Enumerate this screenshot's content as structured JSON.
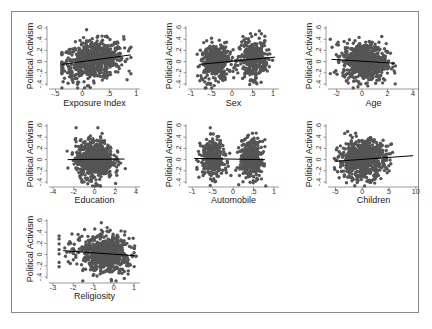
{
  "figure": {
    "frame_color": "#8a8a8a",
    "dot_color": "#555555",
    "line_color": "#000000"
  },
  "chart_data": [
    {
      "type": "scatter",
      "title": "",
      "xlabel": "Exposure Index",
      "ylabel": "Political Activism",
      "xticks": [
        "-.5",
        "0",
        ".5",
        "1"
      ],
      "xtick_values": [
        -0.5,
        0,
        0.5,
        1
      ],
      "xlim": [
        -0.6,
        1.05
      ],
      "yticks": [
        "-.4",
        "-.2",
        "0",
        ".2",
        ".4",
        ".6"
      ],
      "ytick_values": [
        -0.4,
        -0.2,
        0,
        0.2,
        0.4,
        0.6
      ],
      "ylim": [
        -0.5,
        0.65
      ],
      "distribution": {
        "x_center": 0.2,
        "x_spread": 0.28,
        "x_min": -0.38,
        "x_max": 0.9,
        "clusters": 1
      },
      "fit_line": {
        "x": [
          -0.38,
          0.9
        ],
        "y": [
          -0.05,
          0.12
        ]
      },
      "grid": false,
      "legend": null
    },
    {
      "type": "scatter",
      "title": "",
      "xlabel": "Sex",
      "ylabel": "Political Activism",
      "xticks": [
        "-1",
        "-.5",
        "0",
        ".5",
        "1"
      ],
      "xtick_values": [
        -1,
        -0.5,
        0,
        0.5,
        1
      ],
      "xlim": [
        -1.05,
        1.12
      ],
      "yticks": [
        "-.4",
        "-.2",
        "0",
        ".2",
        ".4",
        ".6"
      ],
      "ytick_values": [
        -0.4,
        -0.2,
        0,
        0.2,
        0.4,
        0.6
      ],
      "ylim": [
        -0.5,
        0.65
      ],
      "distribution": {
        "centers": [
          -0.42,
          0.52
        ],
        "x_spread": 0.17,
        "x_min": -0.85,
        "x_max": 1.0,
        "clusters": 2
      },
      "fit_line": {
        "x": [
          -0.8,
          1.05
        ],
        "y": [
          -0.05,
          0.08
        ]
      },
      "grid": false,
      "legend": null
    },
    {
      "type": "scatter",
      "title": "",
      "xlabel": "Age",
      "ylabel": "Political Activism",
      "xticks": [
        "-2",
        "0",
        "2",
        "4"
      ],
      "xtick_values": [
        -2,
        0,
        2,
        4
      ],
      "xlim": [
        -2.6,
        4.4
      ],
      "yticks": [
        "-.4",
        "-.2",
        "0",
        ".2",
        ".4",
        ".6"
      ],
      "ytick_values": [
        -0.4,
        -0.2,
        0,
        0.2,
        0.4,
        0.6
      ],
      "ylim": [
        -0.5,
        0.65
      ],
      "distribution": {
        "x_center": 0.2,
        "x_spread": 0.85,
        "x_min": -2.5,
        "x_max": 2.9,
        "clusters": 1
      },
      "fit_line": {
        "x": [
          -2.4,
          2.6
        ],
        "y": [
          0.04,
          -0.03
        ]
      },
      "grid": false,
      "legend": null
    },
    {
      "type": "scatter",
      "title": "",
      "xlabel": "Education",
      "ylabel": "Political Activism",
      "xticks": [
        "-4",
        "-2",
        "0",
        "2",
        "4"
      ],
      "xtick_values": [
        -4,
        -2,
        0,
        2,
        4
      ],
      "xlim": [
        -4.3,
        4.3
      ],
      "yticks": [
        "-.4",
        "-.2",
        "0",
        ".2",
        ".4",
        ".6"
      ],
      "ytick_values": [
        -0.4,
        -0.2,
        0,
        0.2,
        0.4,
        0.6
      ],
      "ylim": [
        -0.5,
        0.65
      ],
      "distribution": {
        "x_center": 0.0,
        "x_spread": 0.9,
        "x_min": -2.8,
        "x_max": 3.1,
        "clusters": 1
      },
      "fit_line": {
        "x": [
          -2.6,
          2.9
        ],
        "y": [
          0.0,
          0.01
        ]
      },
      "grid": false,
      "legend": null
    },
    {
      "type": "scatter",
      "title": "",
      "xlabel": "Automobile",
      "ylabel": "Political Activism",
      "xticks": [
        "-1",
        "-.5",
        "0",
        ".5",
        "1"
      ],
      "xtick_values": [
        -1,
        -0.5,
        0,
        0.5,
        1
      ],
      "xlim": [
        -1.08,
        1.1
      ],
      "yticks": [
        "-.4",
        "-.2",
        "0",
        ".2",
        ".4",
        ".6"
      ],
      "ytick_values": [
        -0.4,
        -0.2,
        0,
        0.2,
        0.4,
        0.6
      ],
      "ylim": [
        -0.5,
        0.65
      ],
      "distribution": {
        "centers": [
          -0.5,
          0.45
        ],
        "x_spread": 0.14,
        "x_min": -0.98,
        "x_max": 0.8,
        "clusters": 2
      },
      "fit_line": {
        "x": [
          -0.95,
          0.78
        ],
        "y": [
          0.02,
          0.0
        ]
      },
      "grid": false,
      "legend": null
    },
    {
      "type": "scatter",
      "title": "",
      "xlabel": "Children",
      "ylabel": "Political Activism",
      "xticks": [
        "-5",
        "0",
        "5",
        "10"
      ],
      "xtick_values": [
        -5,
        0,
        5,
        10
      ],
      "xlim": [
        -6.2,
        10.4
      ],
      "yticks": [
        "-.4",
        "-.2",
        "0",
        ".2",
        ".4",
        ".6"
      ],
      "ytick_values": [
        -0.4,
        -0.2,
        0,
        0.2,
        0.4,
        0.6
      ],
      "ylim": [
        -0.5,
        0.65
      ],
      "distribution": {
        "x_center": 0.0,
        "x_spread": 2.2,
        "x_min": -5.2,
        "x_max": 9.5,
        "clusters": 1
      },
      "fit_line": {
        "x": [
          -5.0,
          9.5
        ],
        "y": [
          -0.03,
          0.07
        ]
      },
      "grid": false,
      "legend": null
    },
    {
      "type": "scatter",
      "title": "",
      "xlabel": "Religiosity",
      "ylabel": "Political Activism",
      "xticks": [
        "-3",
        "-2",
        "-1",
        "0",
        "1"
      ],
      "xtick_values": [
        -3,
        -2,
        -1,
        0,
        1
      ],
      "xlim": [
        -3.15,
        1.25
      ],
      "yticks": [
        "-.4",
        "-.2",
        "0",
        ".2",
        ".4",
        ".6"
      ],
      "ytick_values": [
        -0.4,
        -0.2,
        0,
        0.2,
        0.4,
        0.6
      ],
      "ylim": [
        -0.5,
        0.65
      ],
      "distribution": {
        "x_center": -0.3,
        "x_spread": 0.55,
        "x_min": -2.7,
        "x_max": 1.1,
        "clusters": 1,
        "skew": "left"
      },
      "fit_line": {
        "x": [
          -2.5,
          1.05
        ],
        "y": [
          0.07,
          -0.02
        ]
      },
      "grid": false,
      "legend": null
    }
  ]
}
